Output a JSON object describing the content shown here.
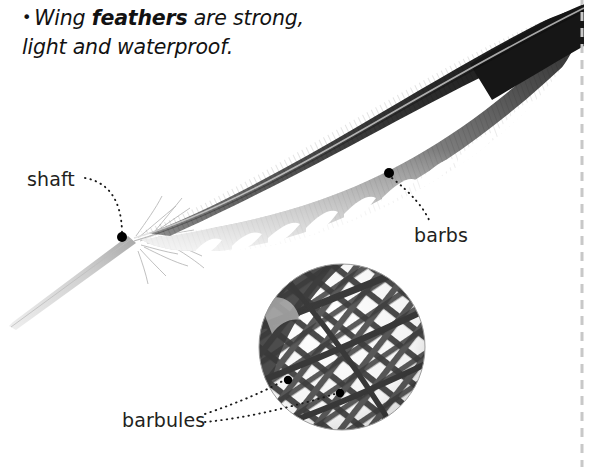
{
  "page": {
    "width": 594,
    "height": 467,
    "background_color": "#ffffff",
    "kind": "illustrated-textbook-figure"
  },
  "caption": {
    "bullet": "•",
    "line1_pre": "Wing ",
    "line1_bold": "feathers",
    "line1_post": " are strong,",
    "line2": "light and waterproof.",
    "full_text": "• Wing feathers are strong, light and waterproof.",
    "style": "bold-italic-emphasis-on-feathers",
    "color": "#121212"
  },
  "labels": {
    "shaft": "shaft",
    "barbs": "barbs",
    "barbules": "barbules"
  },
  "colors": {
    "text": "#231f20",
    "caption_text": "#121212",
    "feather_dark": "#1b1b1b",
    "feather_mid": "#6e6e6e",
    "feather_light": "#c9c9c9",
    "quill": "#d2d2d2",
    "leader_dot": "#000000",
    "divider": "#c8c8c8",
    "inset_mesh": "#4a4a4a"
  },
  "figure": {
    "subject": "wing feather",
    "feather_tip_side": "right",
    "quill_tip_side": "lower-left",
    "inset": {
      "shape": "circle",
      "center_x": 342,
      "center_y": 347,
      "radius": 83,
      "content": "magnified interlocking barbule mesh",
      "marker_dots": 2
    },
    "leaders": [
      {
        "label": "shaft",
        "dot_x": 122,
        "dot_y": 237,
        "style": "dotted-curve"
      },
      {
        "label": "barbs",
        "dot_x": 389,
        "dot_y": 173,
        "style": "dotted-curve"
      },
      {
        "label": "barbules",
        "dot_x": 288,
        "dot_y": 380,
        "style": "dotted-curve"
      },
      {
        "label": "barbules",
        "dot_x": 340,
        "dot_y": 393,
        "style": "dotted-curve"
      }
    ]
  },
  "divider": {
    "orientation": "vertical",
    "x": 582,
    "style": "dashed",
    "color": "#c8c8c8"
  }
}
